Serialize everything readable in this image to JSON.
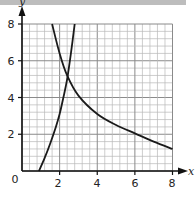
{
  "chart_data": {
    "type": "line",
    "title": "",
    "xlabel": "x",
    "ylabel": "y",
    "xlim": [
      0,
      8
    ],
    "ylim": [
      0,
      8
    ],
    "grid": true,
    "minor_grid_step": 0.4,
    "major_grid_step": 2,
    "x_ticks": [
      "0",
      "2",
      "4",
      "6",
      "8"
    ],
    "y_ticks": [
      "2",
      "4",
      "6",
      "8"
    ],
    "origin_label": "0",
    "series": [
      {
        "name": "decreasing curve",
        "x": [
          1.6,
          2.0,
          2.4,
          3.0,
          4.0,
          5.0,
          6.0,
          7.0,
          8.0
        ],
        "y": [
          8.0,
          6.4,
          5.2,
          4.1,
          3.1,
          2.5,
          2.05,
          1.6,
          1.2
        ]
      },
      {
        "name": "increasing curve",
        "x": [
          0.9,
          1.2,
          1.5,
          1.8,
          2.0,
          2.2,
          2.4,
          2.6,
          2.8
        ],
        "y": [
          0.0,
          0.7,
          1.5,
          2.4,
          3.1,
          4.0,
          5.0,
          6.4,
          8.0
        ]
      }
    ]
  },
  "labels": {
    "x_axis": "x",
    "y_axis": "y",
    "origin": "0",
    "xt": [
      "2",
      "4",
      "6",
      "8"
    ],
    "yt": [
      "2",
      "4",
      "6",
      "8"
    ]
  }
}
